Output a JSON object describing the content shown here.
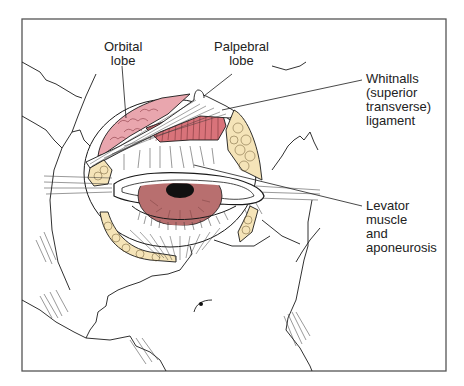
{
  "figure": {
    "colors": {
      "frame": "#555555",
      "line": "#1a1a1a",
      "gland_pink": "#e9a6ae",
      "muscle_red": "#d9737a",
      "fat_yellow": "#f5e4b8",
      "iris": "#b86f6f",
      "pupil": "#111111"
    }
  },
  "labels": {
    "orbital_lobe": {
      "line1": "Orbital",
      "line2": "lobe"
    },
    "palpebral_lobe": {
      "line1": "Palpebral",
      "line2": "lobe"
    },
    "whitnalls": {
      "line1": "Whitnalls",
      "line2": "(superior",
      "line3": "transverse)",
      "line4": "ligament"
    },
    "levator": {
      "line1": "Levator",
      "line2": "muscle",
      "line3": "and",
      "line4": "aponeurosis"
    }
  }
}
